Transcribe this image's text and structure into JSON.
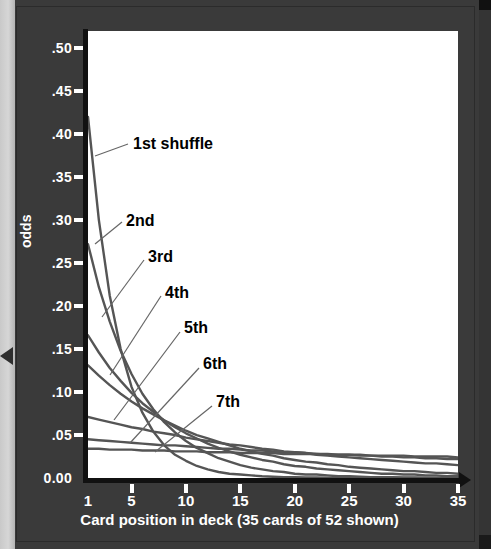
{
  "chart_data": {
    "type": "line",
    "title": "",
    "xlabel": "Card position in deck (35 cards of 52 shown)",
    "ylabel": "odds",
    "xlim": [
      1,
      35
    ],
    "ylim": [
      0.0,
      0.52
    ],
    "grid": false,
    "legend_position": "inline-annotations",
    "x_ticks": [
      "1",
      "5",
      "10",
      "15",
      "20",
      "25",
      "30",
      "35"
    ],
    "x_tick_values": [
      1,
      5,
      10,
      15,
      20,
      25,
      30,
      35
    ],
    "y_ticks": [
      "0.00",
      ".05",
      ".10",
      ".15",
      ".20",
      ".25",
      ".30",
      ".35",
      ".40",
      ".45",
      ".50"
    ],
    "y_tick_values": [
      0.0,
      0.05,
      0.1,
      0.15,
      0.2,
      0.25,
      0.3,
      0.35,
      0.4,
      0.45,
      0.5
    ],
    "line_color": "#555555",
    "plot_bg": "#ffffff",
    "page_bg": "#3a3a3a",
    "axis_color": "#111111",
    "tick_text_color": "#ffffff",
    "annotation_color": "#000000",
    "x": [
      1,
      2,
      3,
      4,
      5,
      6,
      7,
      8,
      9,
      10,
      11,
      12,
      13,
      14,
      15,
      16,
      17,
      18,
      19,
      20,
      21,
      22,
      23,
      24,
      25,
      26,
      27,
      28,
      29,
      30,
      31,
      32,
      33,
      34,
      35
    ],
    "series": [
      {
        "name": "1st shuffle",
        "label": "1st shuffle",
        "values": [
          0.42,
          0.3,
          0.212,
          0.15,
          0.106,
          0.076,
          0.054,
          0.038,
          0.027,
          0.02,
          0.014,
          0.01,
          0.007,
          0.005,
          0.004,
          0.003,
          0.002,
          0.0015,
          0.001,
          0.001,
          0.0007,
          0.0005,
          0.0004,
          0.0003,
          0.0002,
          0.0002,
          0.0001,
          0.0001,
          0.0001,
          0.0001,
          0.0,
          0.0,
          0.0,
          0.0,
          0.0
        ]
      },
      {
        "name": "2nd",
        "label": "2nd",
        "values": [
          0.272,
          0.222,
          0.182,
          0.148,
          0.121,
          0.098,
          0.08,
          0.065,
          0.053,
          0.043,
          0.035,
          0.029,
          0.023,
          0.019,
          0.015,
          0.012,
          0.01,
          0.008,
          0.007,
          0.005,
          0.004,
          0.004,
          0.003,
          0.002,
          0.002,
          0.0015,
          0.001,
          0.001,
          0.0008,
          0.0006,
          0.0005,
          0.0004,
          0.0003,
          0.0002,
          0.0002
        ]
      },
      {
        "name": "3rd",
        "label": "3rd",
        "values": [
          0.166,
          0.146,
          0.128,
          0.113,
          0.099,
          0.087,
          0.077,
          0.067,
          0.059,
          0.052,
          0.046,
          0.04,
          0.035,
          0.031,
          0.027,
          0.024,
          0.021,
          0.019,
          0.016,
          0.014,
          0.013,
          0.011,
          0.01,
          0.009,
          0.008,
          0.007,
          0.006,
          0.005,
          0.005,
          0.004,
          0.004,
          0.003,
          0.003,
          0.002,
          0.002
        ]
      },
      {
        "name": "4th",
        "label": "4th",
        "values": [
          0.131,
          0.119,
          0.108,
          0.098,
          0.089,
          0.081,
          0.074,
          0.067,
          0.061,
          0.055,
          0.05,
          0.046,
          0.042,
          0.038,
          0.034,
          0.031,
          0.028,
          0.026,
          0.023,
          0.021,
          0.019,
          0.018,
          0.016,
          0.015,
          0.013,
          0.012,
          0.011,
          0.01,
          0.009,
          0.008,
          0.008,
          0.007,
          0.006,
          0.006,
          0.005
        ]
      },
      {
        "name": "5th",
        "label": "5th",
        "values": [
          0.071,
          0.068,
          0.065,
          0.062,
          0.059,
          0.057,
          0.054,
          0.052,
          0.05,
          0.047,
          0.045,
          0.043,
          0.041,
          0.039,
          0.038,
          0.036,
          0.034,
          0.033,
          0.031,
          0.03,
          0.029,
          0.027,
          0.026,
          0.025,
          0.024,
          0.023,
          0.022,
          0.021,
          0.02,
          0.019,
          0.018,
          0.017,
          0.017,
          0.016,
          0.015
        ]
      },
      {
        "name": "6th",
        "label": "6th",
        "values": [
          0.045,
          0.044,
          0.043,
          0.042,
          0.041,
          0.04,
          0.039,
          0.038,
          0.038,
          0.037,
          0.036,
          0.035,
          0.034,
          0.034,
          0.033,
          0.032,
          0.032,
          0.031,
          0.03,
          0.03,
          0.029,
          0.028,
          0.028,
          0.027,
          0.027,
          0.026,
          0.026,
          0.025,
          0.025,
          0.024,
          0.024,
          0.023,
          0.023,
          0.022,
          0.022
        ]
      },
      {
        "name": "7th",
        "label": "7th",
        "values": [
          0.034,
          0.034,
          0.033,
          0.033,
          0.033,
          0.032,
          0.032,
          0.032,
          0.031,
          0.031,
          0.031,
          0.03,
          0.03,
          0.03,
          0.029,
          0.029,
          0.029,
          0.029,
          0.028,
          0.028,
          0.028,
          0.028,
          0.027,
          0.027,
          0.027,
          0.027,
          0.026,
          0.026,
          0.026,
          0.026,
          0.025,
          0.025,
          0.025,
          0.025,
          0.024
        ]
      }
    ],
    "annotations": [
      {
        "text": "1st shuffle",
        "x_px": 133,
        "y_px": 145
      },
      {
        "text": "2nd",
        "x_px": 126,
        "y_px": 222
      },
      {
        "text": "3rd",
        "x_px": 148,
        "y_px": 258
      },
      {
        "text": "4th",
        "x_px": 165,
        "y_px": 294
      },
      {
        "text": "5th",
        "x_px": 184,
        "y_px": 329
      },
      {
        "text": "6th",
        "x_px": 203,
        "y_px": 365
      },
      {
        "text": "7th",
        "x_px": 216,
        "y_px": 403
      }
    ]
  }
}
